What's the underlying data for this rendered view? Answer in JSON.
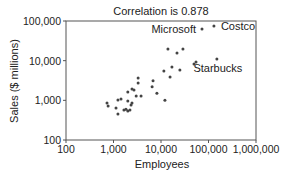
{
  "chart_data": {
    "type": "scatter",
    "title": "Correlation is 0.878",
    "xlabel": "Employees",
    "ylabel": "Sales ($ millions)",
    "xscale": "log",
    "yscale": "log",
    "xlim": [
      100,
      1000000
    ],
    "ylim": [
      100,
      100000
    ],
    "xticks": [
      100,
      1000,
      10000,
      100000,
      1000000
    ],
    "xtick_labels": [
      "100",
      "1,000",
      "10,000",
      "100,000",
      "1,000,000"
    ],
    "yticks": [
      100,
      1000,
      10000,
      100000
    ],
    "ytick_labels": [
      "100",
      "1,000",
      "10,000",
      "100,000"
    ],
    "grid": false,
    "correlation": 0.878,
    "points": [
      {
        "x": 73000,
        "y": 63000,
        "label": "Microsoft"
      },
      {
        "x": 130000,
        "y": 75000,
        "label": "Costco"
      },
      {
        "x": 150000,
        "y": 11000,
        "label": "Starbucks"
      },
      {
        "x": 14000,
        "y": 19700
      },
      {
        "x": 21700,
        "y": 15600
      },
      {
        "x": 29000,
        "y": 19700
      },
      {
        "x": 11500,
        "y": 5500
      },
      {
        "x": 17000,
        "y": 6900
      },
      {
        "x": 25000,
        "y": 5800
      },
      {
        "x": 49500,
        "y": 8200
      },
      {
        "x": 54600,
        "y": 9250
      },
      {
        "x": 6800,
        "y": 3100
      },
      {
        "x": 15500,
        "y": 3900
      },
      {
        "x": 6500,
        "y": 2200
      },
      {
        "x": 8200,
        "y": 1500
      },
      {
        "x": 12100,
        "y": 1000
      },
      {
        "x": 3300,
        "y": 3650
      },
      {
        "x": 3300,
        "y": 2740
      },
      {
        "x": 2000,
        "y": 1620
      },
      {
        "x": 2450,
        "y": 1930
      },
      {
        "x": 2700,
        "y": 1820
      },
      {
        "x": 3000,
        "y": 1290
      },
      {
        "x": 3800,
        "y": 1290
      },
      {
        "x": 1240,
        "y": 1020
      },
      {
        "x": 1440,
        "y": 1080
      },
      {
        "x": 2000,
        "y": 960
      },
      {
        "x": 2450,
        "y": 860
      },
      {
        "x": 2340,
        "y": 760
      },
      {
        "x": 730,
        "y": 860
      },
      {
        "x": 770,
        "y": 720
      },
      {
        "x": 1130,
        "y": 640
      },
      {
        "x": 1660,
        "y": 570
      },
      {
        "x": 1830,
        "y": 600
      },
      {
        "x": 2000,
        "y": 540
      },
      {
        "x": 2220,
        "y": 570
      },
      {
        "x": 1240,
        "y": 450
      }
    ],
    "annotations": [
      {
        "text": "Microsoft",
        "near": "Microsoft"
      },
      {
        "text": "Costco",
        "near": "Costco"
      },
      {
        "text": "Starbucks",
        "near": "Starbucks"
      }
    ]
  },
  "colors": {
    "axis": "#555555",
    "point": "#444444",
    "text": "#222222"
  }
}
